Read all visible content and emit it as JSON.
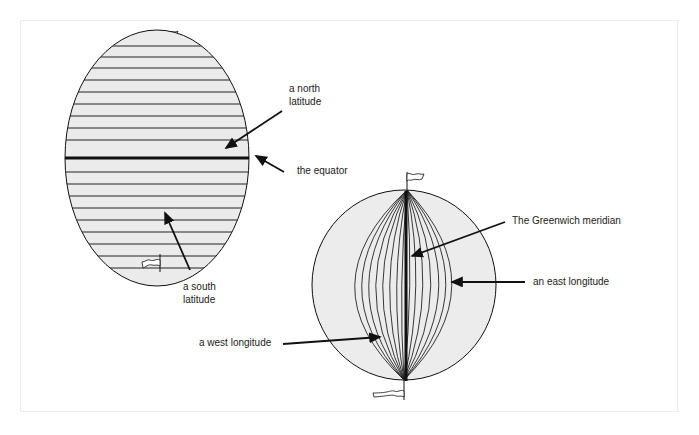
{
  "diagram": {
    "left_globe": {
      "name": "latitude-globe",
      "labels": {
        "north_latitude": [
          "a north",
          "latitude"
        ],
        "equator": "the equator",
        "south_latitude": [
          "a south",
          "latitude"
        ]
      }
    },
    "right_globe": {
      "name": "longitude-globe",
      "labels": {
        "greenwich": "The Greenwich meridian",
        "east_longitude": "an east longitude",
        "west_longitude": "a west longitude"
      }
    },
    "colors": {
      "line": "#111111",
      "globe_fill": "#e9e9e9",
      "background": "#ffffff",
      "frame": "#ececec"
    }
  }
}
